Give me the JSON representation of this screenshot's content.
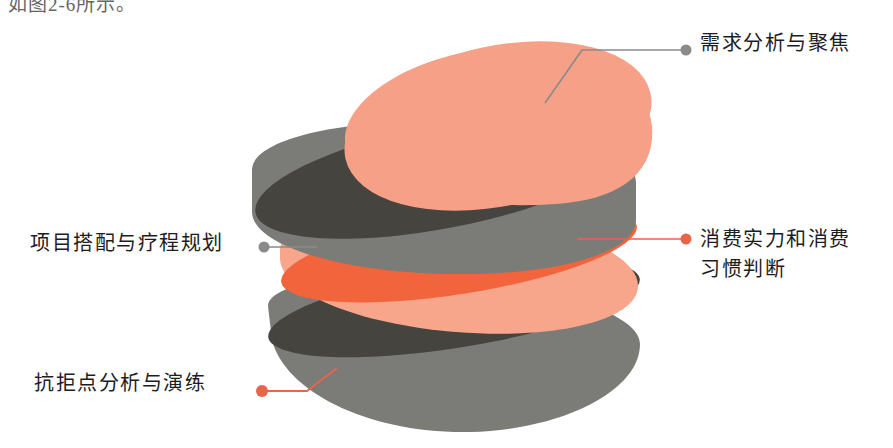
{
  "page": {
    "caption_partial": "如图2-6所示。",
    "background": "#ffffff"
  },
  "diagram": {
    "type": "exploded-layered-sphere",
    "title": "",
    "palette": {
      "salmon_light": "#F5A087",
      "salmon_mid": "#F7A68C",
      "orange_bright": "#F2643C",
      "gray_dark": "#46443F",
      "gray_mid": "#7B7B78",
      "gray_leader": "#8A8A8A",
      "orange_leader": "#E8654A",
      "text": "#1d1d1d"
    },
    "layers": [
      {
        "id": "layer-1",
        "name": "top-salmon-cap",
        "top_color": "#F5A087",
        "side_color": "#F5A087"
      },
      {
        "id": "layer-2",
        "name": "dark-gray-slice",
        "top_color": "#46443F",
        "side_color": "#7B7B78"
      },
      {
        "id": "layer-3",
        "name": "orange-salmon-slice",
        "top_color": "#F2643C",
        "side_color": "#F7A68C"
      },
      {
        "id": "layer-4",
        "name": "bottom-gray-slice",
        "top_color": "#46443F",
        "side_color": "#7B7B78"
      }
    ]
  },
  "labels": {
    "top_right": {
      "text": "需求分析与聚焦",
      "dot_color": "#8A8A8A",
      "line_color": "#8A8A8A",
      "target_layer": "layer-1"
    },
    "mid_right": {
      "text": "消费实力和消费\n习惯判断",
      "dot_color": "#E8654A",
      "line_color": "#E8654A",
      "target_layer": "layer-2"
    },
    "mid_left": {
      "text": "项目搭配与疗程规划",
      "dot_color": "#8A8A8A",
      "line_color": "#8A8A8A",
      "target_layer": "layer-3"
    },
    "bottom_left": {
      "text": "抗拒点分析与演练",
      "dot_color": "#E8654A",
      "line_color": "#E8654A",
      "target_layer": "layer-4"
    }
  }
}
